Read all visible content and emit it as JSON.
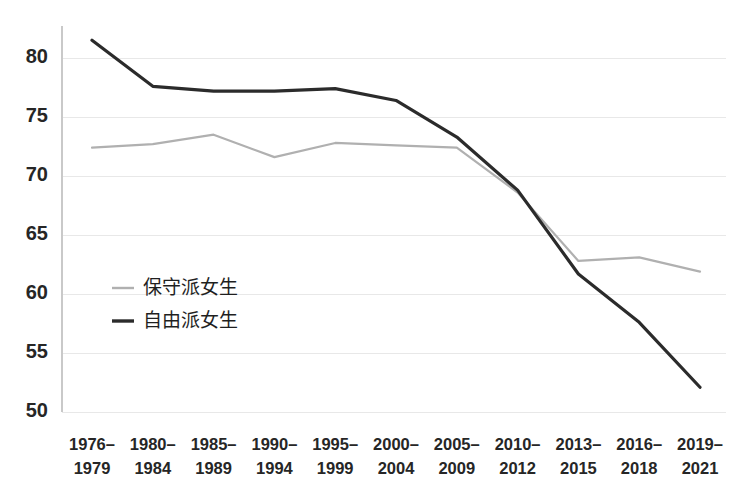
{
  "chart_data": {
    "type": "line",
    "title": "",
    "subtitle": "",
    "xlabel": "",
    "ylabel": "",
    "categories": [
      "1976–\n1979",
      "1980–\n1984",
      "1985–\n1989",
      "1990–\n1994",
      "1995–\n1999",
      "2000–\n2004",
      "2005–\n2009",
      "2010–\n2012",
      "2013–\n2015",
      "2016–\n2018",
      "2019–\n2021"
    ],
    "category_lines": [
      [
        "1976–",
        "1979"
      ],
      [
        "1980–",
        "1984"
      ],
      [
        "1985–",
        "1989"
      ],
      [
        "1990–",
        "1994"
      ],
      [
        "1995–",
        "1999"
      ],
      [
        "2000–",
        "2004"
      ],
      [
        "2005–",
        "2009"
      ],
      [
        "2010–",
        "2012"
      ],
      [
        "2013–",
        "2015"
      ],
      [
        "2016–",
        "2018"
      ],
      [
        "2019–",
        "2021"
      ]
    ],
    "series": [
      {
        "name": "保守派女生",
        "color": "#b0b0b0",
        "stroke_width": 2.2,
        "values": [
          72.4,
          72.7,
          73.5,
          71.6,
          72.8,
          72.6,
          72.4,
          68.6,
          62.8,
          63.1,
          61.9
        ]
      },
      {
        "name": "自由派女生",
        "color": "#2b2b2b",
        "stroke_width": 3.2,
        "values": [
          81.5,
          77.6,
          77.2,
          77.2,
          77.4,
          76.4,
          73.3,
          68.8,
          61.7,
          57.6,
          52.1
        ]
      }
    ],
    "ylim": [
      50,
      82.5
    ],
    "yticks": [
      50,
      55,
      60,
      65,
      70,
      75,
      80
    ],
    "ytick_labels": [
      "50",
      "55",
      "60",
      "65",
      "70",
      "75",
      "80"
    ],
    "grid": true,
    "grid_axis": "y",
    "legend_position": "inside-left-lower",
    "legend": [
      {
        "label": "保守派女生",
        "color": "#b0b0b0"
      },
      {
        "label": "自由派女生",
        "color": "#2b2b2b"
      }
    ],
    "colors": {
      "background": "#ffffff",
      "grid": "#e8e8e8",
      "axis": "#c9c9c9",
      "text": "#262626",
      "series_conservative": "#b0b0b0",
      "series_liberal": "#2b2b2b"
    }
  }
}
